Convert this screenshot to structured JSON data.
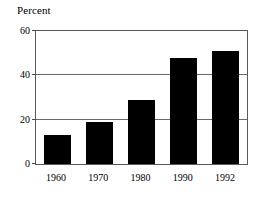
{
  "chart_data": {
    "type": "bar",
    "title": "Percent",
    "xlabel": "",
    "ylabel": "Percent",
    "categories": [
      "1960",
      "1970",
      "1980",
      "1990",
      "1992"
    ],
    "values": [
      13,
      19,
      29,
      48,
      51
    ],
    "series": [
      {
        "name": "Percent",
        "values": [
          13,
          19,
          29,
          48,
          51
        ]
      }
    ],
    "ylim": [
      0,
      60
    ],
    "yticks": [
      0,
      20,
      40,
      60
    ],
    "ytick_labels": [
      "0",
      "20",
      "40",
      "60"
    ],
    "gridlines": [
      20,
      40
    ],
    "grid": true,
    "legend": "none",
    "bar_color": "#000000",
    "frame_color": "#5a5a5a",
    "background": "#ffffff"
  }
}
